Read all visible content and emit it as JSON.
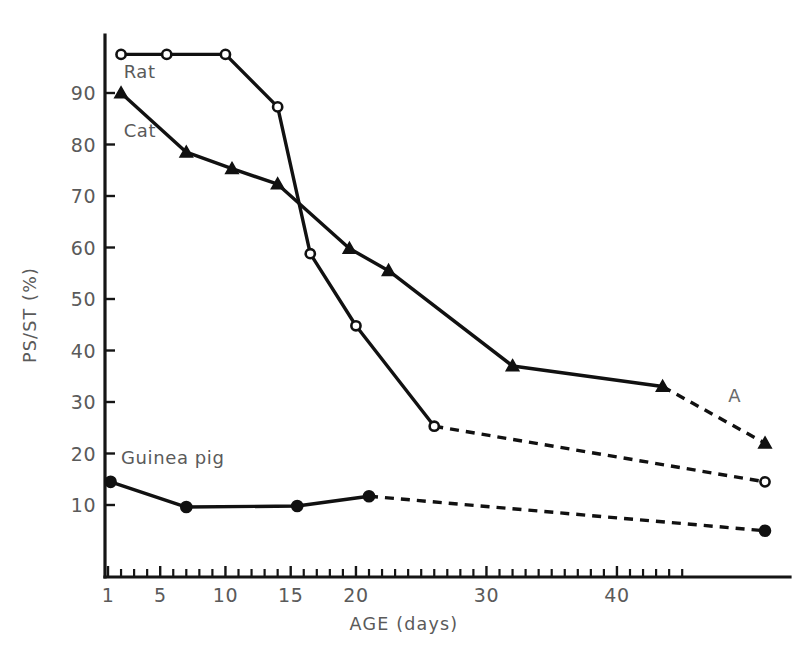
{
  "chart_data": {
    "type": "line",
    "title": "",
    "xlabel": "AGE (days)",
    "ylabel": "PS/ST (%)",
    "xlim": [
      0,
      52
    ],
    "ylim": [
      0,
      100
    ],
    "grid": false,
    "legend": "inline-labels",
    "x_ticks_major": [
      1,
      5,
      10,
      15,
      20,
      30,
      40
    ],
    "x_tick_labels": [
      "1",
      "5",
      "10",
      "15",
      "20",
      "30",
      "40"
    ],
    "y_ticks_major": [
      10,
      20,
      30,
      40,
      50,
      60,
      70,
      80,
      90
    ],
    "y_tick_labels": [
      "10",
      "20",
      "30",
      "40",
      "50",
      "60",
      "70",
      "80",
      "90"
    ],
    "x_axis_break_after_day": 45,
    "adult_x_position": 51,
    "annotations": [
      {
        "text": "A",
        "x": 49,
        "y": 30
      }
    ],
    "series": [
      {
        "name": "Rat",
        "marker": "open-circle",
        "label_x": 2.2,
        "label_y": 93,
        "solid_points": [
          {
            "x": 2.0,
            "y": 97.5
          },
          {
            "x": 5.5,
            "y": 97.5
          },
          {
            "x": 10.0,
            "y": 97.5
          },
          {
            "x": 14.0,
            "y": 87.3
          },
          {
            "x": 16.5,
            "y": 58.8
          },
          {
            "x": 20.0,
            "y": 44.8
          },
          {
            "x": 26.0,
            "y": 25.3
          }
        ],
        "dashed_points": [
          {
            "x": 26.0,
            "y": 25.3
          },
          {
            "x": 51.0,
            "y": 14.5
          }
        ]
      },
      {
        "name": "Cat",
        "marker": "filled-triangle",
        "label_x": 2.2,
        "label_y": 81.5,
        "solid_points": [
          {
            "x": 2.0,
            "y": 90.0
          },
          {
            "x": 7.0,
            "y": 78.5
          },
          {
            "x": 10.5,
            "y": 75.3
          },
          {
            "x": 14.0,
            "y": 72.3
          },
          {
            "x": 19.5,
            "y": 59.8
          },
          {
            "x": 22.5,
            "y": 55.5
          },
          {
            "x": 32.0,
            "y": 37.0
          },
          {
            "x": 43.5,
            "y": 33.0
          }
        ],
        "dashed_points": [
          {
            "x": 43.5,
            "y": 33.0
          },
          {
            "x": 51.0,
            "y": 22.0
          }
        ]
      },
      {
        "name": "Guinea pig",
        "marker": "filled-circle",
        "label_x": 2.0,
        "label_y": 18.0,
        "solid_points": [
          {
            "x": 1.2,
            "y": 14.5
          },
          {
            "x": 7.0,
            "y": 9.6
          },
          {
            "x": 15.5,
            "y": 9.8
          },
          {
            "x": 21.0,
            "y": 11.7
          }
        ],
        "dashed_points": [
          {
            "x": 21.0,
            "y": 11.7
          },
          {
            "x": 51.0,
            "y": 5.0
          }
        ]
      }
    ]
  },
  "colors": {
    "ink": "#111111",
    "text": "#5a5a5a",
    "background": "#ffffff"
  }
}
